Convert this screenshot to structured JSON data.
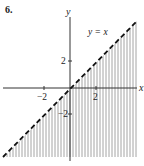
{
  "problem_number": "6.",
  "chart_data": {
    "type": "area",
    "title": "",
    "xlabel": "x",
    "ylabel": "y",
    "x_ticks": [
      -2,
      2
    ],
    "y_ticks": [
      2,
      -2
    ],
    "x_tick_labels": [
      "−2",
      "2"
    ],
    "y_tick_labels": [
      "2",
      "−2"
    ],
    "xlim": [
      -5.3,
      5.2
    ],
    "ylim": [
      -5.5,
      5.4
    ],
    "series": [
      {
        "name": "y = x",
        "style": "dashed",
        "x": [
          -5.2,
          5.2
        ],
        "y": [
          -5.2,
          5.2
        ]
      }
    ],
    "shaded_region": {
      "description": "y < x (region below the dashed line), vertical hatching",
      "inequality": "y < x",
      "boundary_included": false
    },
    "annotations": [
      {
        "text": "y = x",
        "x": 2.4,
        "y": 4.6
      }
    ],
    "grid": false,
    "legend": null
  },
  "labels": {
    "x_axis": "x",
    "y_axis": "y",
    "line_label": "y = x",
    "tick_x_neg2": "−2",
    "tick_x_2": "2",
    "tick_y_2": "2",
    "tick_y_neg2": "−2"
  },
  "colors": {
    "axis": "#333333",
    "hatch": "#9a9a9a",
    "line": "#111111",
    "text": "#222222"
  }
}
